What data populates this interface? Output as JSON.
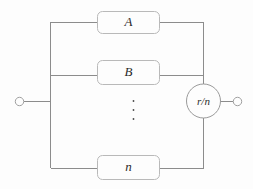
{
  "diagram": {
    "title": "parallel-branch-network",
    "background_color": "#fdfdfd",
    "wire_color": "#8c8c8c",
    "box_stroke_color": "#b9b9b9",
    "label_color": "#2a2a2a",
    "branches": [
      {
        "id": "branch-a",
        "label": "A"
      },
      {
        "id": "branch-b",
        "label": "B"
      },
      {
        "id": "branch-n",
        "label": "n"
      }
    ],
    "ellipsis": "⋮",
    "resistor": {
      "label": "r/n"
    },
    "terminals": {
      "left": "",
      "right": ""
    }
  }
}
